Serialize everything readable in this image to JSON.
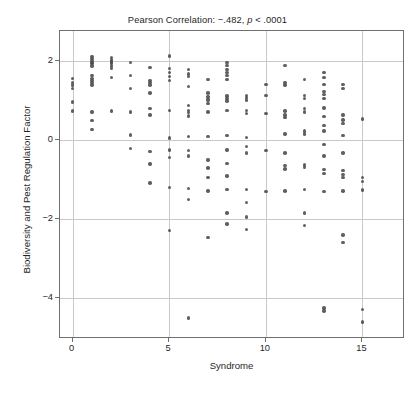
{
  "chart_data": {
    "type": "scatter",
    "title": "Pearson Correlation: −.482, p < .0001",
    "title_prefix": "Pearson Correlation: −.482, ",
    "title_italic": "p",
    "title_suffix": " < .0001",
    "xlabel": "Syndrome",
    "ylabel": "Biodiversity and Pest Regulation Factor",
    "xlim": [
      -0.65,
      17.2
    ],
    "ylim": [
      -5.05,
      2.75
    ],
    "xticks": [
      0,
      5,
      10,
      15
    ],
    "xtick_labels": [
      "0",
      "5",
      "10",
      "15"
    ],
    "yticks": [
      2,
      0,
      -2,
      -4
    ],
    "ytick_labels": [
      "2",
      "0",
      "−2",
      "−4"
    ],
    "grid": true,
    "grid_axes": "both",
    "legend": "none",
    "marker_color": "#4a4a4a",
    "frame_color": "#6f6f6f",
    "gridline_color": "#c9c9c9",
    "correlation_r": -0.482,
    "p_value": "< .0001",
    "points": [
      [
        0,
        1.55
      ],
      [
        0,
        1.45
      ],
      [
        0,
        1.38
      ],
      [
        0,
        1.3
      ],
      [
        0,
        0.95
      ],
      [
        0,
        0.72
      ],
      [
        1,
        2.1
      ],
      [
        1,
        2.05
      ],
      [
        1,
        2.0
      ],
      [
        1,
        1.96
      ],
      [
        1,
        1.92
      ],
      [
        1,
        1.86
      ],
      [
        1,
        1.62
      ],
      [
        1,
        1.55
      ],
      [
        1,
        1.5
      ],
      [
        1,
        1.44
      ],
      [
        1,
        1.38
      ],
      [
        1,
        0.7
      ],
      [
        1,
        0.48
      ],
      [
        1,
        0.26
      ],
      [
        2,
        2.08
      ],
      [
        2,
        2.02
      ],
      [
        2,
        1.97
      ],
      [
        2,
        1.92
      ],
      [
        2,
        1.86
      ],
      [
        2,
        1.8
      ],
      [
        2,
        1.58
      ],
      [
        2,
        0.72
      ],
      [
        3,
        1.96
      ],
      [
        3,
        1.62
      ],
      [
        3,
        1.3
      ],
      [
        3,
        0.7
      ],
      [
        3,
        0.12
      ],
      [
        3,
        -0.22
      ],
      [
        4,
        1.82
      ],
      [
        4,
        1.5
      ],
      [
        4,
        1.44
      ],
      [
        4,
        1.38
      ],
      [
        4,
        1.18
      ],
      [
        4,
        0.78
      ],
      [
        4,
        0.62
      ],
      [
        4,
        -0.3
      ],
      [
        4,
        -0.62
      ],
      [
        4,
        -1.1
      ],
      [
        5,
        2.12
      ],
      [
        5,
        1.8
      ],
      [
        5,
        1.7
      ],
      [
        5,
        1.6
      ],
      [
        5,
        1.5
      ],
      [
        5,
        0.74
      ],
      [
        5,
        0.04
      ],
      [
        5,
        -0.26
      ],
      [
        5,
        -0.46
      ],
      [
        5,
        -1.22
      ],
      [
        5,
        -2.3
      ],
      [
        6,
        1.78
      ],
      [
        6,
        1.66
      ],
      [
        6,
        1.6
      ],
      [
        6,
        1.34
      ],
      [
        6,
        0.86
      ],
      [
        6,
        0.74
      ],
      [
        6,
        0.68
      ],
      [
        6,
        0.6
      ],
      [
        6,
        0.08
      ],
      [
        6,
        -0.28
      ],
      [
        6,
        -0.42
      ],
      [
        6,
        -1.24
      ],
      [
        6,
        -1.52
      ],
      [
        6,
        -4.52
      ],
      [
        7,
        1.52
      ],
      [
        7,
        1.18
      ],
      [
        7,
        1.08
      ],
      [
        7,
        1.0
      ],
      [
        7,
        0.92
      ],
      [
        7,
        0.7
      ],
      [
        7,
        0.08
      ],
      [
        7,
        -0.52
      ],
      [
        7,
        -0.72
      ],
      [
        7,
        -0.96
      ],
      [
        7,
        -1.3
      ],
      [
        7,
        -2.48
      ],
      [
        8,
        1.96
      ],
      [
        8,
        1.88
      ],
      [
        8,
        1.78
      ],
      [
        8,
        1.7
      ],
      [
        8,
        1.62
      ],
      [
        8,
        1.52
      ],
      [
        8,
        1.1
      ],
      [
        8,
        1.04
      ],
      [
        8,
        0.98
      ],
      [
        8,
        0.74
      ],
      [
        8,
        0.1
      ],
      [
        8,
        -0.26
      ],
      [
        8,
        -0.6
      ],
      [
        8,
        -0.92
      ],
      [
        8,
        -1.26
      ],
      [
        8,
        -1.86
      ],
      [
        8,
        -2.14
      ],
      [
        9,
        1.12
      ],
      [
        9,
        1.06
      ],
      [
        9,
        1.0
      ],
      [
        9,
        0.74
      ],
      [
        9,
        0.66
      ],
      [
        9,
        0.06
      ],
      [
        9,
        -0.18
      ],
      [
        9,
        -0.34
      ],
      [
        9,
        -1.26
      ],
      [
        9,
        -1.6
      ],
      [
        9,
        -1.96
      ],
      [
        9,
        -2.28
      ],
      [
        10,
        1.4
      ],
      [
        10,
        1.12
      ],
      [
        10,
        0.66
      ],
      [
        10,
        -0.28
      ],
      [
        10,
        -1.32
      ],
      [
        11,
        1.88
      ],
      [
        11,
        1.44
      ],
      [
        11,
        1.38
      ],
      [
        11,
        0.72
      ],
      [
        11,
        0.62
      ],
      [
        11,
        0.56
      ],
      [
        11,
        0.14
      ],
      [
        11,
        -0.34
      ],
      [
        11,
        -0.66
      ],
      [
        11,
        -0.74
      ],
      [
        11,
        -1.3
      ],
      [
        12,
        1.52
      ],
      [
        12,
        1.12
      ],
      [
        12,
        1.04
      ],
      [
        12,
        0.78
      ],
      [
        12,
        0.7
      ],
      [
        12,
        0.22
      ],
      [
        12,
        0.14
      ],
      [
        12,
        -0.64
      ],
      [
        12,
        -0.7
      ],
      [
        12,
        -1.26
      ],
      [
        12,
        -1.86
      ],
      [
        12,
        -2.18
      ],
      [
        13,
        1.7
      ],
      [
        13,
        1.58
      ],
      [
        13,
        1.4
      ],
      [
        13,
        1.22
      ],
      [
        13,
        1.14
      ],
      [
        13,
        1.04
      ],
      [
        13,
        0.8
      ],
      [
        13,
        0.58
      ],
      [
        13,
        0.36
      ],
      [
        13,
        0.22
      ],
      [
        13,
        -0.12
      ],
      [
        13,
        -0.42
      ],
      [
        13,
        -0.76
      ],
      [
        13,
        -0.86
      ],
      [
        13,
        -1.32
      ],
      [
        13,
        -4.26
      ],
      [
        13,
        -4.34
      ],
      [
        14,
        1.4
      ],
      [
        14,
        1.3
      ],
      [
        14,
        0.62
      ],
      [
        14,
        0.5
      ],
      [
        14,
        0.4
      ],
      [
        14,
        0.1
      ],
      [
        14,
        -0.34
      ],
      [
        14,
        -0.78
      ],
      [
        14,
        -0.88
      ],
      [
        14,
        -0.96
      ],
      [
        14,
        -1.3
      ],
      [
        14,
        -2.42
      ],
      [
        14,
        -2.6
      ],
      [
        15,
        0.52
      ],
      [
        15,
        -0.96
      ],
      [
        15,
        -1.06
      ],
      [
        15,
        -1.28
      ],
      [
        15,
        -4.3
      ],
      [
        15,
        -4.62
      ]
    ]
  },
  "caption": {
    "sliver_text": " "
  }
}
